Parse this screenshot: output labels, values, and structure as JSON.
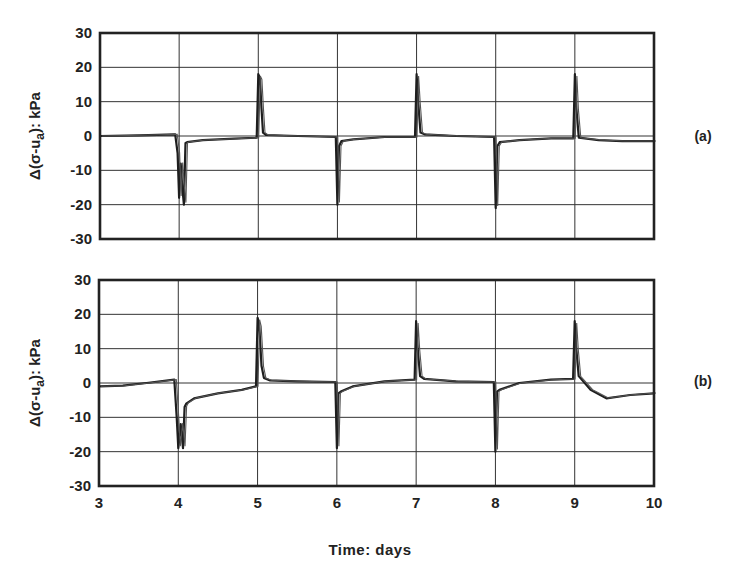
{
  "chart_data": [
    {
      "type": "line",
      "panel_label": "(a)",
      "title": "",
      "xlabel": "",
      "ylabel": "Δ(σ-u_a): kPa",
      "ylabel_main": "Δ(σ-u",
      "ylabel_sub": "a",
      "ylabel_tail": "): kPa",
      "xlim": [
        3,
        10
      ],
      "ylim": [
        -30,
        30
      ],
      "yticks": [
        30,
        20,
        10,
        0,
        -10,
        -20,
        -30
      ],
      "xticks": [
        3,
        4,
        5,
        6,
        7,
        8,
        9,
        10
      ],
      "grid": true,
      "series": [
        {
          "name": "Δ(σ-u_a) (a)",
          "x": [
            3.0,
            3.5,
            3.95,
            3.98,
            4.0,
            4.02,
            4.04,
            4.06,
            4.08,
            4.1,
            4.3,
            4.7,
            4.98,
            5.0,
            5.02,
            5.04,
            5.06,
            5.1,
            5.5,
            5.98,
            6.0,
            6.02,
            6.05,
            6.2,
            6.6,
            6.98,
            7.0,
            7.02,
            7.05,
            7.1,
            7.5,
            7.98,
            8.0,
            8.02,
            8.05,
            8.3,
            8.7,
            8.98,
            9.0,
            9.02,
            9.05,
            9.3,
            9.6,
            10.0
          ],
          "y": [
            0.0,
            0.2,
            0.5,
            -5,
            -18,
            -8,
            -15,
            -20,
            -2,
            -1.8,
            -1.2,
            -0.8,
            -0.5,
            18,
            17,
            8,
            1,
            0.3,
            0,
            -0.3,
            -20,
            -3,
            -1.5,
            -1,
            -0.3,
            -0.3,
            18,
            10,
            1,
            0.5,
            0,
            -0.3,
            -21,
            -3,
            -1.8,
            -1.2,
            -0.7,
            -0.7,
            18,
            8,
            -0.5,
            -1.2,
            -1.5,
            -1.5
          ]
        }
      ]
    },
    {
      "type": "line",
      "panel_label": "(b)",
      "title": "",
      "xlabel": "Time: days",
      "ylabel": "Δ(σ-u_a): kPa",
      "ylabel_main": "Δ(σ-u",
      "ylabel_sub": "a",
      "ylabel_tail": "): kPa",
      "xlim": [
        3,
        10
      ],
      "ylim": [
        -30,
        30
      ],
      "yticks": [
        30,
        20,
        10,
        0,
        -10,
        -20,
        -30
      ],
      "xticks": [
        3,
        4,
        5,
        6,
        7,
        8,
        9,
        10
      ],
      "grid": true,
      "series": [
        {
          "name": "Δ(σ-u_a) (b)",
          "x": [
            3.0,
            3.3,
            3.6,
            3.95,
            3.98,
            4.0,
            4.03,
            4.06,
            4.08,
            4.1,
            4.2,
            4.5,
            4.8,
            4.98,
            5.0,
            5.02,
            5.05,
            5.08,
            5.15,
            5.5,
            5.98,
            6.0,
            6.02,
            6.05,
            6.2,
            6.6,
            6.98,
            7.0,
            7.02,
            7.05,
            7.1,
            7.5,
            7.98,
            8.0,
            8.02,
            8.05,
            8.3,
            8.7,
            8.98,
            9.0,
            9.02,
            9.05,
            9.2,
            9.4,
            9.7,
            10.0
          ],
          "y": [
            -1.0,
            -0.8,
            0.0,
            1.0,
            -10,
            -19,
            -12,
            -19,
            -7,
            -6,
            -4.5,
            -3,
            -2,
            -1,
            19,
            17,
            5,
            1.5,
            0.8,
            0.5,
            0.3,
            -19,
            -3,
            -2.5,
            -1,
            0.5,
            1.0,
            18,
            10,
            2,
            1.2,
            0.5,
            0.3,
            -20,
            -2.5,
            -2,
            0,
            1.0,
            1.2,
            18,
            10,
            2,
            -2,
            -4.5,
            -3.5,
            -3
          ]
        }
      ]
    }
  ]
}
